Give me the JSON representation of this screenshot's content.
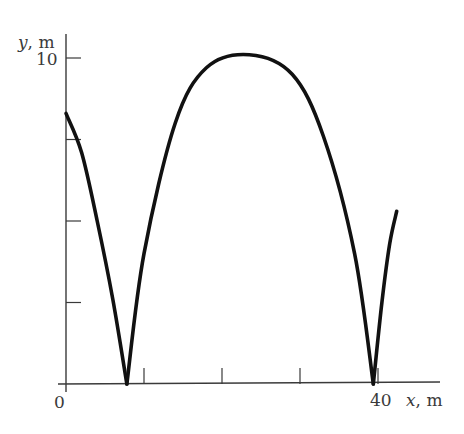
{
  "chart_data": {
    "type": "line",
    "title": "",
    "xlabel": "x, m",
    "ylabel": "y, m",
    "xlim": [
      0,
      47
    ],
    "ylim": [
      0,
      11
    ],
    "grid": false,
    "legend": null,
    "x_ticks": [
      10,
      20,
      30,
      40
    ],
    "x_tick_labels": {
      "0": "0",
      "40": "40"
    },
    "y_ticks": [
      2.5,
      5,
      7.5,
      10
    ],
    "y_tick_labels": {
      "10": "10"
    },
    "origin_label": "0",
    "series": [
      {
        "name": "trajectory",
        "description": "Bouncing projectile path: descending arc from y≈8.3 m, bounce at x≈7.8 m, high arc peaking ≈10.1 m at x≈23.5 m, bounce at x≈39.4 m, rising to ≈5.3 m at x≈42.4 m",
        "segments": [
          {
            "x": [
              0,
              2,
              4,
              6,
              7.8
            ],
            "y": [
              8.3,
              7.1,
              5.0,
              2.6,
              0
            ]
          },
          {
            "x": [
              7.8,
              10,
              14,
              18,
              23.5,
              29,
              33,
              37,
              39.4
            ],
            "y": [
              0,
              4.0,
              8.0,
              9.7,
              10.1,
              9.5,
              7.6,
              4.0,
              0
            ]
          },
          {
            "x": [
              39.4,
              40.5,
              41.5,
              42.4
            ],
            "y": [
              0,
              2.5,
              4.3,
              5.3
            ]
          }
        ]
      }
    ]
  },
  "labels": {
    "ylabel": "y, m",
    "xlabel": "x, m",
    "y10": "10",
    "x40": "40",
    "origin": "0"
  },
  "colors": {
    "curve": "#111111",
    "axis": "#3a3a3a",
    "background": "#ffffff"
  }
}
